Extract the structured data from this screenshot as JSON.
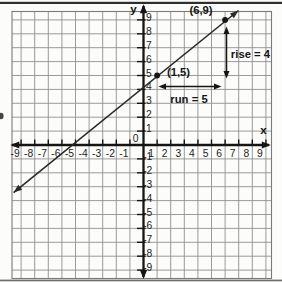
{
  "chart_data": {
    "type": "line",
    "title": "",
    "xlabel": "x",
    "ylabel": "y",
    "origin_label": "0",
    "xlim": [
      -9,
      9
    ],
    "ylim": [
      -9,
      9
    ],
    "grid": true,
    "x_ticks": [
      -9,
      -8,
      -7,
      -6,
      -5,
      -4,
      -3,
      -2,
      -1,
      1,
      2,
      3,
      4,
      5,
      6,
      7,
      8,
      9
    ],
    "y_ticks": [
      9,
      8,
      7,
      6,
      5,
      4,
      3,
      2,
      1,
      -1,
      -2,
      -3,
      -4,
      -5,
      -6,
      -7,
      -8,
      -9
    ],
    "series": [
      {
        "name": "plotted-line",
        "slope": 0.8,
        "y_intercept": 4.2,
        "marked_points": [
          {
            "x": 1,
            "y": 5,
            "label": "(1,5)"
          },
          {
            "x": 6,
            "y": 9,
            "label": "(6,9)"
          }
        ]
      }
    ],
    "slope_annotations": {
      "rise": {
        "label": "rise = 4",
        "value": 4,
        "at_x": 6,
        "from_y": 5,
        "to_y": 9
      },
      "run": {
        "label": "run = 5",
        "value": 5,
        "at_y": 4.3,
        "from_x": 1,
        "to_x": 6
      }
    }
  },
  "colors": {
    "background": "#fcfcfa",
    "grid": "#909090",
    "frame": "#7a7a7a",
    "axis": "#151515",
    "line": "#2a2a2a",
    "text": "#1c1c1c",
    "border_top": "#2f2f2f",
    "border_bottom": "#6e6e6e"
  }
}
